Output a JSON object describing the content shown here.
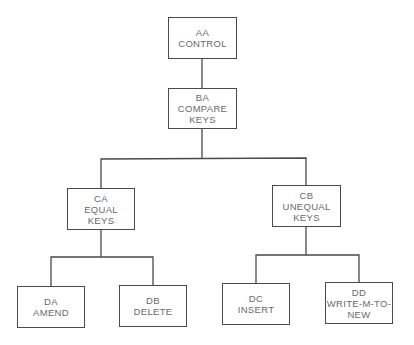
{
  "nodes": {
    "aa": {
      "code": "AA",
      "line1": "CONTROL",
      "line2": ""
    },
    "ba": {
      "code": "BA",
      "line1": "COMPARE",
      "line2": "KEYS"
    },
    "ca": {
      "code": "CA",
      "line1": "EQUAL",
      "line2": "KEYS"
    },
    "cb": {
      "code": "CB",
      "line1": "UNEQUAL",
      "line2": "KEYS"
    },
    "da": {
      "code": "DA",
      "line1": "AMEND",
      "line2": ""
    },
    "db": {
      "code": "DB",
      "line1": "DELETE",
      "line2": ""
    },
    "dc": {
      "code": "DC",
      "line1": "INSERT",
      "line2": ""
    },
    "dd": {
      "code": "DD",
      "line1": "WRITE-M-TO-",
      "line2": "NEW"
    }
  },
  "edges": [
    {
      "from": "AA",
      "to": "BA"
    },
    {
      "from": "BA",
      "to": "CA"
    },
    {
      "from": "BA",
      "to": "CB"
    },
    {
      "from": "CA",
      "to": "DA"
    },
    {
      "from": "CA",
      "to": "DB"
    },
    {
      "from": "CB",
      "to": "DC"
    },
    {
      "from": "CB",
      "to": "DD"
    }
  ],
  "colors": {
    "line": "#4a4a4a",
    "text": "#6a6a6a",
    "background": "#ffffff"
  }
}
